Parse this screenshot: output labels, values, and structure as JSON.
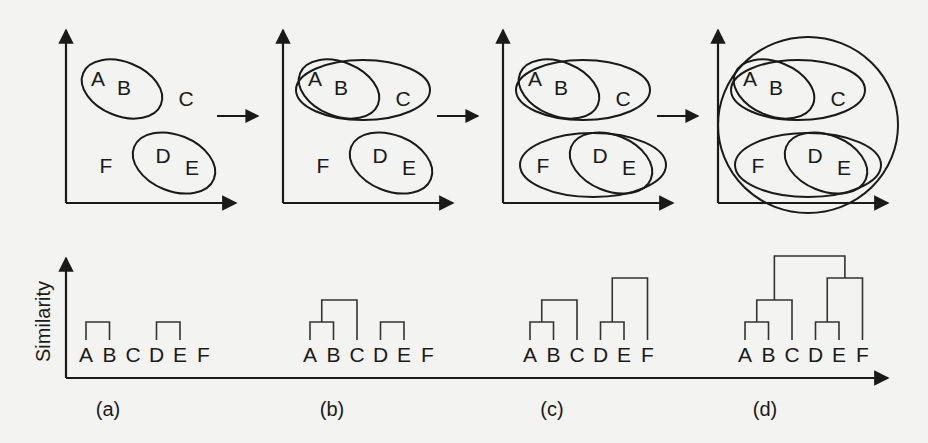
{
  "figure": {
    "type": "hierarchical-clustering-illustration",
    "y_axis_label": "Similarity",
    "stage_labels": [
      "(a)",
      "(b)",
      "(c)",
      "(d)"
    ],
    "points": [
      "A",
      "B",
      "C",
      "D",
      "E",
      "F"
    ],
    "flow_arrows": 3,
    "stages": [
      {
        "label": "(a)",
        "clusters": [
          [
            "A",
            "B"
          ],
          [
            "D",
            "E"
          ]
        ],
        "dendrogram_merges": [
          {
            "members": [
              "A",
              "B"
            ],
            "level": 1
          },
          {
            "members": [
              "D",
              "E"
            ],
            "level": 1
          }
        ]
      },
      {
        "label": "(b)",
        "clusters": [
          [
            "A",
            "B"
          ],
          [
            "A",
            "B",
            "C"
          ],
          [
            "D",
            "E"
          ]
        ],
        "dendrogram_merges": [
          {
            "members": [
              "A",
              "B"
            ],
            "level": 1
          },
          {
            "members": [
              "AB",
              "C"
            ],
            "level": 2
          },
          {
            "members": [
              "D",
              "E"
            ],
            "level": 1
          }
        ]
      },
      {
        "label": "(c)",
        "clusters": [
          [
            "A",
            "B"
          ],
          [
            "A",
            "B",
            "C"
          ],
          [
            "D",
            "E"
          ],
          [
            "D",
            "E",
            "F"
          ]
        ],
        "dendrogram_merges": [
          {
            "members": [
              "A",
              "B"
            ],
            "level": 1
          },
          {
            "members": [
              "AB",
              "C"
            ],
            "level": 2
          },
          {
            "members": [
              "D",
              "E"
            ],
            "level": 1
          },
          {
            "members": [
              "DE",
              "F"
            ],
            "level": 3
          }
        ]
      },
      {
        "label": "(d)",
        "clusters": [
          [
            "A",
            "B"
          ],
          [
            "A",
            "B",
            "C"
          ],
          [
            "D",
            "E"
          ],
          [
            "D",
            "E",
            "F"
          ],
          [
            "A",
            "B",
            "C",
            "D",
            "E",
            "F"
          ]
        ],
        "dendrogram_merges": [
          {
            "members": [
              "A",
              "B"
            ],
            "level": 1
          },
          {
            "members": [
              "AB",
              "C"
            ],
            "level": 2
          },
          {
            "members": [
              "D",
              "E"
            ],
            "level": 1
          },
          {
            "members": [
              "DE",
              "F"
            ],
            "level": 3
          },
          {
            "members": [
              "ABC",
              "DEF"
            ],
            "level": 4
          }
        ]
      }
    ]
  }
}
